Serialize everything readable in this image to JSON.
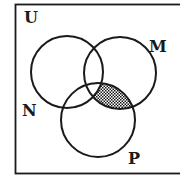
{
  "diagram": {
    "type": "venn",
    "universe": {
      "label": "U",
      "label_pos": [
        24,
        23
      ]
    },
    "sets": [
      {
        "id": "N",
        "label": "N",
        "cx": 67,
        "cy": 72,
        "r": 36,
        "label_pos": [
          22,
          116
        ]
      },
      {
        "id": "M",
        "label": "M",
        "cx": 120,
        "cy": 73,
        "r": 36,
        "label_pos": [
          149,
          52
        ]
      },
      {
        "id": "P",
        "label": "P",
        "cx": 98,
        "cy": 120,
        "r": 37,
        "label_pos": [
          128,
          164
        ]
      }
    ],
    "shaded_region": {
      "description": "M ∩ P ∖ N",
      "inside": [
        "M",
        "P"
      ],
      "outside": [
        "N"
      ],
      "pattern": "dotted-grid"
    },
    "colors": {
      "stroke": "#1a1a1a",
      "background": "#ffffff",
      "shade": "#1a1a1a"
    }
  }
}
